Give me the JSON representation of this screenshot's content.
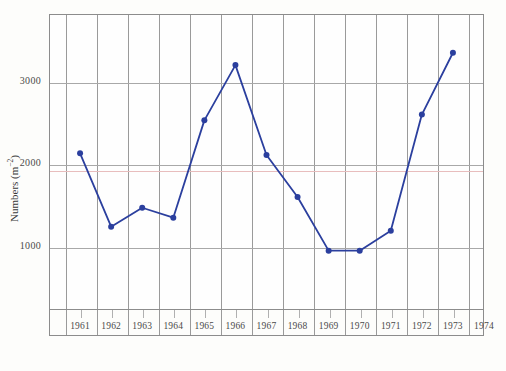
{
  "chart_data": {
    "type": "line",
    "title": "",
    "subtitle": "",
    "xlabel": "",
    "ylabel": "Numbers (m",
    "ylabel_sup": "−2",
    "ylabel_suffix": ")",
    "ylabel_full": "Numbers (m−2)",
    "x": [
      1961.5,
      1962.5,
      1963.5,
      1964.5,
      1965.5,
      1966.5,
      1967.5,
      1968.5,
      1969.5,
      1970.5,
      1971.5,
      1972.5,
      1973.5
    ],
    "values": [
      2130,
      1240,
      1470,
      1350,
      2530,
      3200,
      2110,
      1600,
      950,
      950,
      1190,
      2600,
      3350
    ],
    "series": [
      {
        "name": "Numbers",
        "color": "#2b3f9e",
        "marker": "circle",
        "values": [
          2130,
          1240,
          1470,
          1350,
          2530,
          3200,
          2110,
          1600,
          950,
          950,
          1190,
          2600,
          3350
        ]
      }
    ],
    "xtick_labels": [
      "1961",
      "1962",
      "1963",
      "1964",
      "1965",
      "1966",
      "1967",
      "1968",
      "1969",
      "1970",
      "1971",
      "1972",
      "1973",
      "1974"
    ],
    "xtick_values": [
      1961,
      1962,
      1963,
      1964,
      1965,
      1966,
      1967,
      1968,
      1969,
      1970,
      1971,
      1972,
      1973,
      1974
    ],
    "ytick_labels": [
      "1000",
      "2000",
      "3000"
    ],
    "ytick_values": [
      1000,
      2000,
      3000
    ],
    "xlim": [
      1960.5,
      1974.5
    ],
    "ylim": [
      230,
      3820
    ],
    "grid": true,
    "grid_x": true,
    "grid_y": true,
    "legend": false,
    "legend_position": "none",
    "accent_line": {
      "value": 1930,
      "color": "#e8bdbd",
      "label": ""
    },
    "colors": {
      "line": "#2b3f9e",
      "marker": "#1f35a0",
      "grid": "#a8a8a8",
      "axis": "#8c8c8c",
      "text": "#3a3a3a",
      "accent": "#e8bdbd",
      "background": "#fefefe"
    }
  }
}
